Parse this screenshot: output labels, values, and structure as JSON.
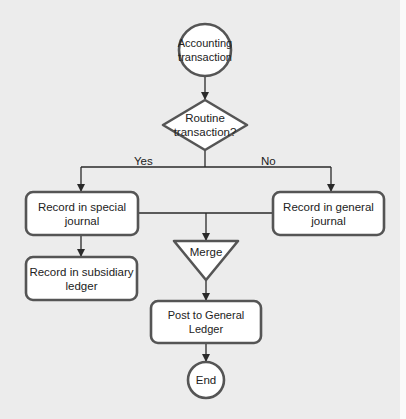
{
  "diagram": {
    "type": "flowchart",
    "stroke_color": "#4a4a4a",
    "fill_color": "#ffffff",
    "background_color": "#ececec",
    "nodes": [
      {
        "id": "start",
        "shape": "circle",
        "label": "Accounting transaction",
        "lines": [
          "Accounting",
          "transaction"
        ]
      },
      {
        "id": "decision",
        "shape": "diamond",
        "label": "Routine transaction?",
        "lines": [
          "Routine",
          "transaction?"
        ]
      },
      {
        "id": "special",
        "shape": "rounded-rect",
        "label": "Record in special journal",
        "lines": [
          "Record in special",
          "journal"
        ]
      },
      {
        "id": "general",
        "shape": "rounded-rect",
        "label": "Record in general journal",
        "lines": [
          "Record in general",
          "journal"
        ]
      },
      {
        "id": "subsidiary",
        "shape": "rounded-rect",
        "label": "Record in subsidiary ledger",
        "lines": [
          "Record in subsidiary",
          "ledger"
        ]
      },
      {
        "id": "merge",
        "shape": "inverted-triangle",
        "label": "Merge"
      },
      {
        "id": "post",
        "shape": "rounded-rect",
        "label": "Post to General Ledger"
      },
      {
        "id": "end",
        "shape": "circle",
        "label": "End"
      }
    ],
    "edges": [
      {
        "from": "start",
        "to": "decision",
        "label": ""
      },
      {
        "from": "decision",
        "to": "special",
        "label": "Yes"
      },
      {
        "from": "decision",
        "to": "general",
        "label": "No"
      },
      {
        "from": "special",
        "to": "subsidiary",
        "label": ""
      },
      {
        "from": "special",
        "to": "merge",
        "label": ""
      },
      {
        "from": "general",
        "to": "merge",
        "label": ""
      },
      {
        "from": "merge",
        "to": "post",
        "label": ""
      },
      {
        "from": "post",
        "to": "end",
        "label": ""
      }
    ],
    "edge_labels": {
      "yes": "Yes",
      "no": "No"
    }
  }
}
